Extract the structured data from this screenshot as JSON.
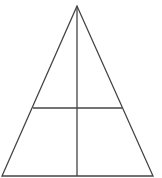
{
  "diagram": {
    "type": "geometric-figure",
    "stroke_color": "#444444",
    "background": "#ffffff",
    "shapes": {
      "triangle": {
        "apex": [
          77,
          6
        ],
        "base_left": [
          2,
          176
        ],
        "base_right": [
          153,
          176
        ]
      },
      "vertical_line": {
        "from": [
          77,
          6
        ],
        "to": [
          77,
          176
        ]
      },
      "horizontal_line": {
        "from": [
          33,
          108
        ],
        "to": [
          122,
          108
        ]
      }
    }
  }
}
